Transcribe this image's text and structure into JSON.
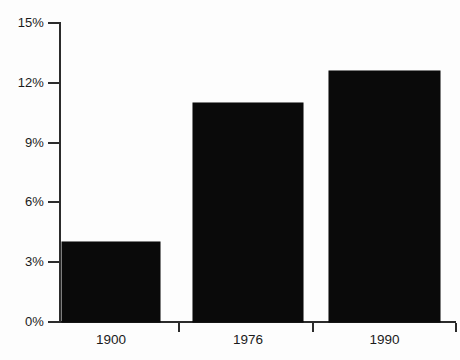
{
  "chart_data": {
    "type": "bar",
    "title": "",
    "subtitle": "",
    "xlabel": "",
    "ylabel": "",
    "categories": [
      "1900",
      "1976",
      "1990"
    ],
    "values": [
      4.0,
      11.0,
      12.6
    ],
    "value_unit": "%",
    "series": [
      {
        "name": "",
        "values": [
          4.0,
          11.0,
          12.6
        ]
      }
    ],
    "ylim": [
      0,
      15
    ],
    "y_ticks": [
      0,
      3,
      6,
      9,
      12,
      15
    ],
    "y_tick_labels": [
      "0%",
      "3%",
      "6%",
      "9%",
      "12%",
      "15%"
    ],
    "x_ticks": [
      "1900",
      "1976",
      "1990"
    ],
    "grid": false,
    "legend": false,
    "legend_position": "none",
    "annotations": [],
    "bar_color": "#0a0a0a",
    "axis_color": "#2b2b2b",
    "background_color": "#fdfdfd"
  },
  "axis": {
    "y_labels": [
      {
        "text": "15%",
        "value": 15
      },
      {
        "text": "12%",
        "value": 12
      },
      {
        "text": "9%",
        "value": 9
      },
      {
        "text": "6%",
        "value": 6
      },
      {
        "text": "3%",
        "value": 3
      },
      {
        "text": "0%",
        "value": 0
      }
    ],
    "x_labels": [
      {
        "text": "1900"
      },
      {
        "text": "1976"
      },
      {
        "text": "1990"
      }
    ]
  }
}
